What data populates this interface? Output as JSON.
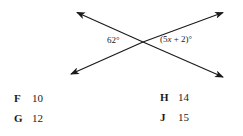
{
  "figure": {
    "name": "intersecting-lines-diagram",
    "angle_left": {
      "text": "62°",
      "value": 62
    },
    "angle_right": {
      "prefix": "(5",
      "variable": "x",
      "suffix": " + 2)°",
      "full_text": "(5x + 2)°"
    },
    "stroke_color": "#1a1a1a",
    "line1": {
      "label": "line-upper-left-to-lower-right",
      "x1": 74,
      "y1": 10,
      "x2": 226,
      "y2": 78
    },
    "line2": {
      "label": "line-lower-left-to-upper-right",
      "x1": 67,
      "y1": 77,
      "x2": 226,
      "y2": 10
    },
    "intersection": {
      "x": 143,
      "y": 42
    }
  },
  "choices": [
    {
      "key": "F",
      "value": "10"
    },
    {
      "key": "G",
      "value": "12"
    },
    {
      "key": "H",
      "value": "14"
    },
    {
      "key": "J",
      "value": "15"
    }
  ]
}
